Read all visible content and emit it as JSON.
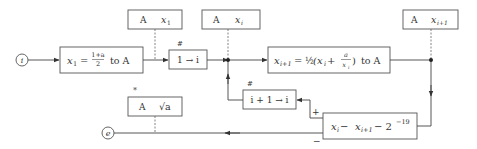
{
  "diagram": {
    "type": "flowchart",
    "nodes": {
      "start": {
        "label": "i"
      },
      "end": {
        "label": "e"
      },
      "init": {
        "lhs": "x",
        "lhs_sub": "1",
        "eq": "=",
        "frac_num": "1+a",
        "frac_den": "2",
        "suffix": "to A"
      },
      "set_i": {
        "label": "1 → i",
        "mark": "#"
      },
      "iterate": {
        "lhs": "x",
        "lhs_sub": "i+1",
        "eq": "= ",
        "half": "½",
        "body": "(x",
        "body_sub": "i",
        "plus": " + ",
        "frac_num": "a",
        "frac_den": "x",
        "frac_den_sub": "i",
        "close": ")",
        "suffix": "to A"
      },
      "inc_i": {
        "label": "i + 1 → i",
        "mark": "#"
      },
      "test": {
        "a": "x",
        "a_sub": "i",
        "minus1": " − ",
        "b": "x",
        "b_sub": "i+1",
        "minus2": " − 2",
        "exp": "−19"
      },
      "mem_x1": {
        "reg": "A",
        "val": "x",
        "val_sub": "1"
      },
      "mem_xi": {
        "reg": "A",
        "val": "x",
        "val_sub": "i"
      },
      "mem_xi1": {
        "reg": "A",
        "val": "x",
        "val_sub": "i+1"
      },
      "mem_result": {
        "reg": "A",
        "val": "√a",
        "mark": "*"
      }
    },
    "branch_labels": {
      "plus": "+",
      "minus": "−"
    }
  }
}
